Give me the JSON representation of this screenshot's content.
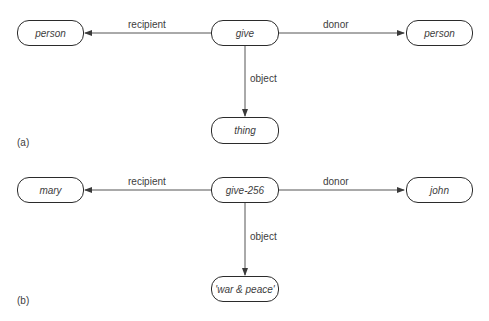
{
  "panels": [
    {
      "label": "(a)",
      "nodes": {
        "center": "give",
        "left": "person",
        "right": "person",
        "bottom": "thing"
      },
      "edges": {
        "left": "recipient",
        "right": "donor",
        "bottom": "object"
      }
    },
    {
      "label": "(b)",
      "nodes": {
        "center": "give-256",
        "left": "mary",
        "right": "john",
        "bottom": "'war & peace'"
      },
      "edges": {
        "left": "recipient",
        "right": "donor",
        "bottom": "object"
      }
    }
  ]
}
